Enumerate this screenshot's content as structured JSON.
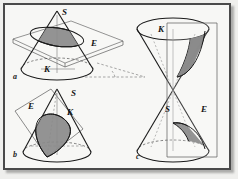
{
  "figure": {
    "background_color": "#f7f7f5",
    "frame_color": "#4a4a4a",
    "outline_color": "#1a1a1a",
    "shade_color": "#8a8a8a",
    "plane_color": "#5a5a5a",
    "dashed_color": "#6e6e6e"
  },
  "panels": [
    {
      "id": "a",
      "label": "a",
      "name": "ellipse-panel",
      "section_type": "ellipse",
      "labels": {
        "apex": "S",
        "plane": "E",
        "cone": "K"
      }
    },
    {
      "id": "b",
      "label": "b",
      "name": "parabola-panel",
      "section_type": "parabola",
      "labels": {
        "apex": "S",
        "plane": "E",
        "cone": "K"
      }
    },
    {
      "id": "c",
      "label": "c",
      "name": "hyperbola-panel",
      "section_type": "hyperbola",
      "labels": {
        "apex": "S",
        "plane": "E",
        "cone": "K"
      }
    }
  ],
  "symbols": {
    "S": "S",
    "E": "E",
    "K": "K",
    "a": "a",
    "b": "b",
    "c": "c"
  }
}
